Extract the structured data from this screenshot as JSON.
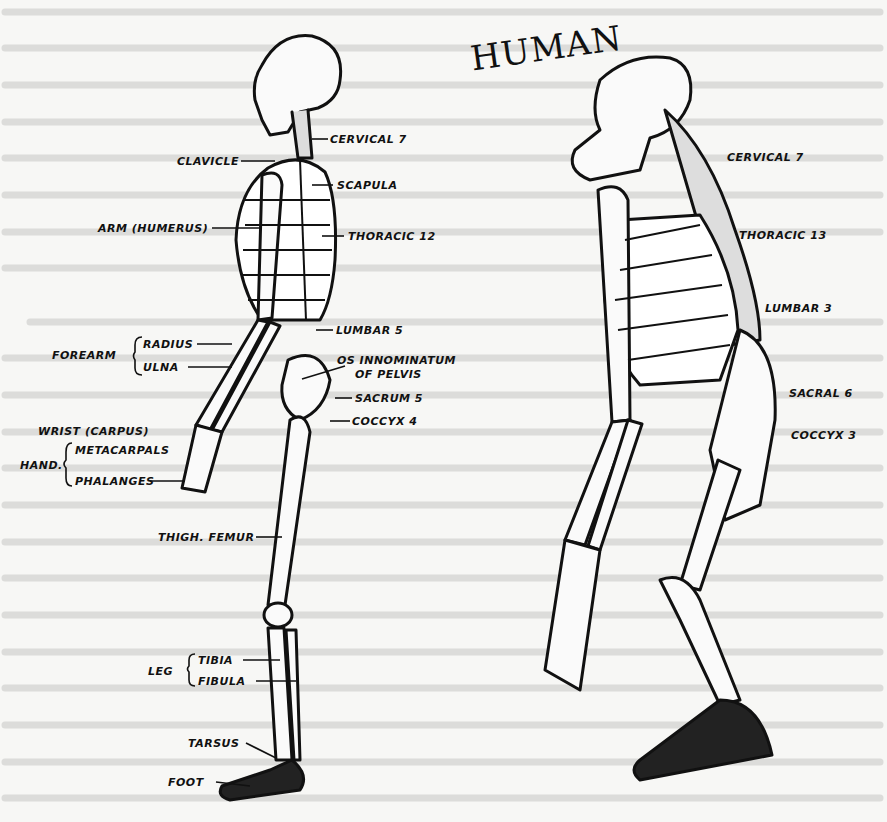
{
  "title": "HUMAN",
  "figures": {
    "human": {
      "labels": {
        "cervical": "CERVICAL 7",
        "clavicle": "CLAVICLE",
        "scapula": "SCAPULA",
        "humerus": "ARM (HUMERUS)",
        "thoracic": "THORACIC 12",
        "lumbar": "LUMBAR 5",
        "forearm": "FOREARM",
        "radius": "RADIUS",
        "ulna": "ULNA",
        "pelvis_1": "OS INNOMINATUM",
        "pelvis_2": "OF PELVIS",
        "sacrum": "SACRUM 5",
        "coccyx": "COCCYX 4",
        "wrist": "WRIST (CARPUS)",
        "hand": "HAND.",
        "metacarpals": "METACARPALS",
        "phalanges": "PHALANGES",
        "femur": "THIGH. FEMUR",
        "leg": "LEG",
        "tibia": "TIBIA",
        "fibula": "FIBULA",
        "tarsus": "TARSUS",
        "foot": "FOOT"
      }
    },
    "gorilla": {
      "labels": {
        "cervical": "CERVICAL 7",
        "thoracic": "THORACIC 13",
        "lumbar": "LUMBAR 3",
        "sacral": "SACRAL 6",
        "coccyx": "COCCYX 3"
      }
    }
  },
  "colors": {
    "ink": "#111111",
    "paper": "#f7f7f5",
    "bleed": "#888888"
  }
}
